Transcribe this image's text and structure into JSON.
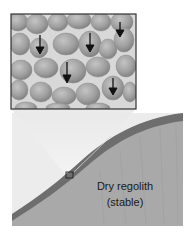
{
  "figure": {
    "inset": {
      "caption": "Regolith grains (magnified)",
      "arrow_direction": "down",
      "arrow_count": 6
    },
    "slope": {
      "label_line1": "Dry regolith",
      "label_line2": "(stable)"
    },
    "colors": {
      "background": "#ffffff",
      "panel_bg": "#ececec",
      "surface_band": "#6e6e6e",
      "regolith_fill": "#a9a9a9",
      "grain_fill": "#9a9a9a",
      "grain_gap": "#d8d8d8",
      "inset_border": "#333333",
      "arrow": "#111111"
    }
  }
}
